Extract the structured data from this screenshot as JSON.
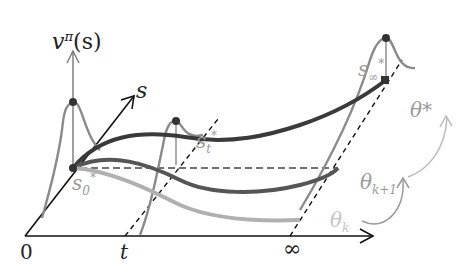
{
  "diagram": {
    "labels": {
      "value_axis": "v",
      "value_axis_sup": "π",
      "value_axis_arg": "(s)",
      "state_axis": "s",
      "origin": "0",
      "time_t": "t",
      "time_inf": "∞",
      "s0": "s",
      "s0_sub": "0",
      "s0_sup": "*",
      "st": "s",
      "st_sub": "t",
      "st_sup": "*",
      "sinf": "s",
      "sinf_sub": "∞",
      "sinf_sup": "*",
      "theta_star": "θ*",
      "theta_k1": "θ",
      "theta_k1_sub": "k+1",
      "theta_k": "θ",
      "theta_k_sub": "k"
    },
    "colors": {
      "axis": "#111111",
      "theta_star_curve": "#3a3a3a",
      "theta_k1_curve": "#555555",
      "theta_k_curve": "#b0b0b0",
      "value_curve": "#8a8a8a",
      "arrow_curve": "#9a9a9a"
    },
    "curves": [
      "θ*",
      "θ_{k+1}",
      "θ_k"
    ]
  }
}
